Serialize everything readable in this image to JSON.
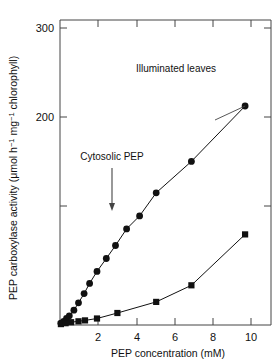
{
  "chart_data": {
    "type": "scatter",
    "title": "",
    "xlabel": "PEP concentration (mM)",
    "ylabel": "PEP carboxylase activity (μmol h⁻¹ mg⁻¹ chlorophyll)",
    "ylabel_parts": {
      "a": "PEP carboxylase activity (μmol h",
      "sup1": "−1",
      "b": " mg",
      "sup2": "−1",
      "c": " chlorophyll)"
    },
    "xlim": [
      0,
      11.4
    ],
    "ylim": [
      0,
      330
    ],
    "xticks": [
      2,
      4,
      6,
      8,
      10
    ],
    "xtick_labels": [
      "2",
      "4",
      "6",
      "8",
      "10"
    ],
    "yticks": [
      100,
      200,
      300
    ],
    "ytick_labels": [
      "",
      "200",
      "300"
    ],
    "grid": false,
    "legend": "none",
    "frame": "box",
    "series": [
      {
        "name": "Illuminated leaves",
        "marker": "circle",
        "color": "#111111",
        "x": [
          0.05,
          0.2,
          0.35,
          0.5,
          0.75,
          1.0,
          1.3,
          1.6,
          2.0,
          2.5,
          3.0,
          3.6,
          4.3,
          5.2,
          7.1,
          10.0
        ],
        "y": [
          2,
          4,
          7,
          10,
          16,
          24,
          34,
          45,
          58,
          72,
          86,
          104,
          118,
          143,
          177,
          237
        ]
      },
      {
        "name": "Cytosolic PEP",
        "marker": "square",
        "color": "#111111",
        "x": [
          0.05,
          0.3,
          0.6,
          1.0,
          1.35,
          2.0,
          3.1,
          5.2,
          7.1,
          10.0
        ],
        "y": [
          1,
          2,
          3,
          4,
          5,
          7,
          13,
          25,
          43,
          98
        ]
      }
    ],
    "annotations": [
      {
        "name": "illuminated-leaves-label",
        "text": "Illuminated leaves",
        "x": 6.1,
        "y": 271
      },
      {
        "name": "cytosolic-pep-label",
        "text": "Cytosolic PEP",
        "x": 1.35,
        "y": 205,
        "arrow": "down"
      }
    ]
  }
}
